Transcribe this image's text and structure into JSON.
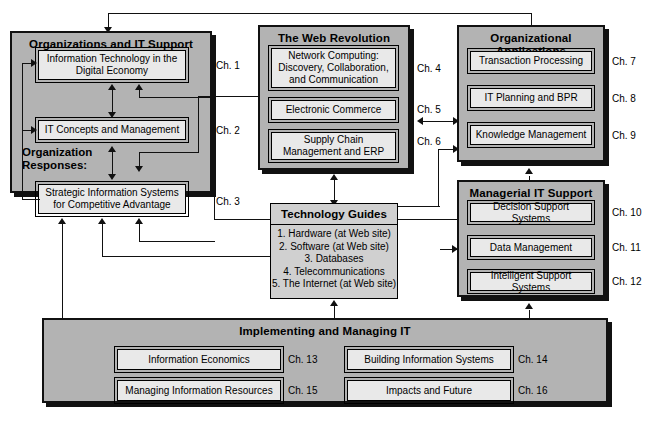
{
  "diagram": {
    "colors": {
      "group_fill": "#b3b3b3",
      "inner_fill": "#e9e9e9",
      "plain_fill": "#d0d0d0",
      "line": "#111111"
    }
  },
  "groups": {
    "organizations": {
      "title": "Organizations and IT Support",
      "sub_label_line1": "Organization",
      "sub_label_line2": "Responses:",
      "items": [
        {
          "label": "Information Technology in the Digital Economy",
          "chapter": "Ch. 1"
        },
        {
          "label": "IT Concepts and Management",
          "chapter": "Ch. 2"
        },
        {
          "label": "Strategic Information Systems for Competitive Advantage",
          "chapter": "Ch. 3"
        }
      ]
    },
    "web_revolution": {
      "title": "The Web Revolution",
      "items": [
        {
          "label": "Network Computing: Discovery, Collaboration, and Communication",
          "chapter": "Ch. 4"
        },
        {
          "label": "Electronic Commerce",
          "chapter": "Ch. 5"
        },
        {
          "label": "Supply Chain Management and ERP",
          "chapter": "Ch. 6"
        }
      ]
    },
    "organizational_applications": {
      "title": "Organizational Applications",
      "items": [
        {
          "label": "Transaction Processing",
          "chapter": "Ch. 7"
        },
        {
          "label": "IT Planning and BPR",
          "chapter": "Ch. 8"
        },
        {
          "label": "Knowledge Management",
          "chapter": "Ch. 9"
        }
      ]
    },
    "managerial_it_support": {
      "title": "Managerial IT Support",
      "items": [
        {
          "label": "Decision Support Systems",
          "chapter": "Ch. 10"
        },
        {
          "label": "Data Management",
          "chapter": "Ch. 11"
        },
        {
          "label": "Intelligent Support Systems",
          "chapter": "Ch. 12"
        }
      ]
    },
    "technology_guides": {
      "title": "Technology Guides",
      "items": [
        "1. Hardware (at Web site)",
        "2. Software (at Web site)",
        "3. Databases",
        "4. Telecommunications",
        "5. The Internet (at Web site)"
      ]
    },
    "implementing": {
      "title": "Implementing and Managing IT",
      "items": [
        {
          "label": "Information Economics",
          "chapter": "Ch. 13"
        },
        {
          "label": "Building Information Systems",
          "chapter": "Ch. 14"
        },
        {
          "label": "Managing Information Resources",
          "chapter": "Ch. 15"
        },
        {
          "label": "Impacts and Future",
          "chapter": "Ch. 16"
        }
      ]
    }
  }
}
